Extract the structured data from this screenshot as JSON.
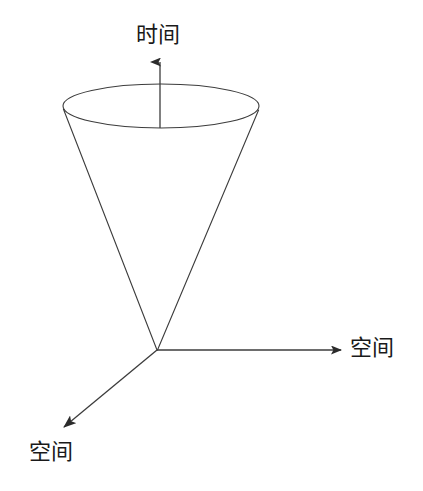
{
  "figure": {
    "kind": "light-cone-spacetime-diagram",
    "width": 423,
    "height": 491,
    "background_color": "#ffffff",
    "stroke_color": "#3c3c3c",
    "text_color": "#1a1a1a",
    "stroke_width": 1.1
  },
  "labels": {
    "time_axis": "时间",
    "space_axis_right": "空间",
    "space_axis_left": "空间"
  },
  "geometry": {
    "origin": {
      "x": 157,
      "y": 350
    },
    "cone_ellipse": {
      "cx": 161,
      "cy": 106,
      "rx": 98,
      "ry": 22
    },
    "cone_left_edge": {
      "x1": 63,
      "y1": 109,
      "x2": 157,
      "y2": 350
    },
    "cone_right_edge": {
      "x1": 259,
      "y1": 110,
      "x2": 157,
      "y2": 350
    },
    "time_axis_line": {
      "x1": 160,
      "y1": 128,
      "x2": 160,
      "y2": 58
    },
    "time_axis_tip": {
      "x": 160,
      "y": 51
    },
    "space_right_line": {
      "x1": 157,
      "y1": 350,
      "x2": 337,
      "y2": 350
    },
    "space_right_tip": {
      "x": 346,
      "y": 350
    },
    "space_left_line": {
      "x1": 157,
      "y1": 350,
      "x2": 66,
      "y2": 425
    },
    "space_left_tip": {
      "x": 56,
      "y": 433
    }
  }
}
